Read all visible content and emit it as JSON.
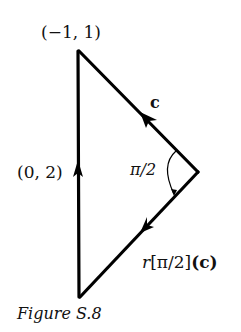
{
  "figure": {
    "caption": "Figure S.8",
    "stroke_color": "#000000",
    "vertices": {
      "top": {
        "label": "(−1, 1)",
        "x": 78,
        "y": 50
      },
      "bottom": {
        "x": 80,
        "y": 297
      },
      "right": {
        "x": 198,
        "y": 172
      }
    },
    "edges": {
      "left": {
        "label": "(0, 2)",
        "direction": "up"
      },
      "upper_right": {
        "label": "c",
        "direction": "toward-top"
      },
      "lower_right": {
        "label_r": "r",
        "label_angle": "[π/2]",
        "label_arg": "(c)",
        "direction": "toward-bottom"
      }
    },
    "angle": {
      "label": "π/2"
    }
  }
}
